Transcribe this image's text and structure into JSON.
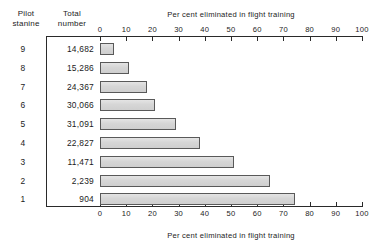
{
  "headers": {
    "stanine": "Pilot\nstanine",
    "total": "Total\nnumber"
  },
  "chart_data": {
    "type": "bar",
    "orientation": "horizontal",
    "title": "",
    "xlabel": "Per cent eliminated in flight training",
    "ylabel": "Pilot stanine",
    "xlim": [
      0,
      100
    ],
    "xticks": [
      0,
      10,
      20,
      30,
      40,
      50,
      60,
      70,
      80,
      90,
      100
    ],
    "xtick_labels": [
      "0",
      "10",
      "20",
      "30",
      "40",
      "50",
      "60",
      "70",
      "80",
      "90",
      "100"
    ],
    "grid": false,
    "legend": null,
    "axis_title_top": "Per cent eliminated in flight training",
    "axis_title_bottom": "Per cent eliminated in flight training",
    "categories": [
      "9",
      "8",
      "7",
      "6",
      "5",
      "4",
      "3",
      "2",
      "1"
    ],
    "values": [
      5.5,
      11,
      18,
      21,
      29,
      38,
      51,
      65,
      74.5
    ],
    "series": [
      {
        "name": "Per cent eliminated in flight training",
        "values": [
          5.5,
          11,
          18,
          21,
          29,
          38,
          51,
          65,
          74.5
        ]
      }
    ],
    "total_number": [
      "14,682",
      "15,286",
      "24,367",
      "30,066",
      "31,091",
      "22,827",
      "11,471",
      "2,239",
      "904"
    ],
    "rows": [
      {
        "stanine": "9",
        "total": "14,682",
        "percent": 5.5
      },
      {
        "stanine": "8",
        "total": "15,286",
        "percent": 11
      },
      {
        "stanine": "7",
        "total": "24,367",
        "percent": 18
      },
      {
        "stanine": "6",
        "total": "30,066",
        "percent": 21
      },
      {
        "stanine": "5",
        "total": "31,091",
        "percent": 29
      },
      {
        "stanine": "4",
        "total": "22,827",
        "percent": 38
      },
      {
        "stanine": "3",
        "total": "11,471",
        "percent": 51
      },
      {
        "stanine": "2",
        "total": "2,239",
        "percent": 65
      },
      {
        "stanine": "1",
        "total": "904",
        "percent": 74.5
      }
    ]
  },
  "colors": {
    "bar_fill": "#d6d6d6",
    "bar_border": "#595959",
    "axis": "#2a2a2a",
    "text": "#1b1b1b",
    "background": "#ffffff"
  },
  "geometry": {
    "x_zero_px": 100,
    "x_span_px": 262,
    "first_bar_top_px": 43,
    "row_pitch_px": 18.8,
    "bar_height_px": 12
  }
}
